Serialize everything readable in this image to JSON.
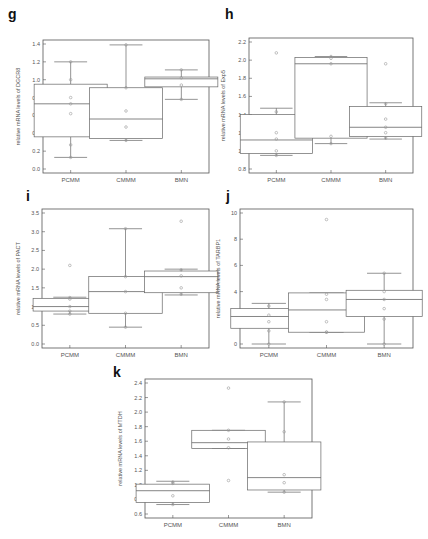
{
  "figure": {
    "panels": [
      {
        "id": "g",
        "letter": "g"
      },
      {
        "id": "h",
        "letter": "h"
      },
      {
        "id": "i",
        "letter": "i"
      },
      {
        "id": "j",
        "letter": "j"
      },
      {
        "id": "k",
        "letter": "k"
      }
    ]
  },
  "chart_data": [
    {
      "panel": "g",
      "type": "box",
      "title": "",
      "xlabel": "",
      "ylabel": "relative mRNA levels of DGCR8",
      "categories": [
        "PCMM",
        "CMMM",
        "BMN"
      ],
      "ylim": [
        0.0,
        1.4
      ],
      "yticks": [
        "0.0",
        "0.2",
        "0.4",
        "0.6",
        "0.8",
        "1.0",
        "1.2",
        "1.4"
      ],
      "grid": false,
      "series": [
        {
          "name": "PCMM",
          "whisker_low": 0.13,
          "q1": 0.36,
          "median": 0.73,
          "q3": 0.95,
          "whisker_high": 1.2,
          "points": [
            0.13,
            0.27,
            0.62,
            0.73,
            0.8,
            1.0,
            1.2
          ],
          "outliers": []
        },
        {
          "name": "CMMM",
          "whisker_low": 0.32,
          "q1": 0.34,
          "median": 0.56,
          "q3": 0.91,
          "whisker_high": 1.39,
          "points": [
            0.32,
            0.47,
            0.65,
            0.91,
            1.39
          ],
          "outliers": []
        },
        {
          "name": "BMN",
          "whisker_low": 0.78,
          "q1": 0.92,
          "median": 1.01,
          "q3": 1.03,
          "whisker_high": 1.11,
          "points": [
            0.78,
            0.94,
            1.02,
            1.11
          ],
          "outliers": []
        }
      ]
    },
    {
      "panel": "h",
      "type": "box",
      "title": "",
      "xlabel": "",
      "ylabel": "relative mRNA levels of Exp5",
      "categories": [
        "PCMM",
        "CMMM",
        "BMN"
      ],
      "ylim": [
        0.8,
        2.2
      ],
      "yticks": [
        "0.8",
        "1.0",
        "1.2",
        "1.4",
        "1.6",
        "1.8",
        "2.0",
        "2.2"
      ],
      "grid": false,
      "series": [
        {
          "name": "PCMM",
          "whisker_low": 0.95,
          "q1": 0.97,
          "median": 1.12,
          "q3": 1.4,
          "whisker_high": 1.47,
          "points": [
            0.95,
            1.0,
            1.13,
            1.2,
            1.43
          ],
          "outliers": [
            2.08
          ]
        },
        {
          "name": "CMMM",
          "whisker_low": 1.08,
          "q1": 1.14,
          "median": 1.96,
          "q3": 2.03,
          "whisker_high": 2.04,
          "points": [
            1.08,
            1.16,
            1.96,
            2.02,
            2.04
          ],
          "outliers": []
        },
        {
          "name": "BMN",
          "whisker_low": 1.13,
          "q1": 1.16,
          "median": 1.26,
          "q3": 1.49,
          "whisker_high": 1.53,
          "points": [
            1.14,
            1.2,
            1.26,
            1.35,
            1.52
          ],
          "outliers": [
            1.96
          ]
        }
      ]
    },
    {
      "panel": "i",
      "type": "box",
      "title": "",
      "xlabel": "",
      "ylabel": "relative mRNA levels of PACT",
      "categories": [
        "PCMM",
        "CMMM",
        "BMN"
      ],
      "ylim": [
        0.0,
        3.5
      ],
      "yticks": [
        "0.0",
        "0.5",
        "1.0",
        "1.5",
        "2.0",
        "2.5",
        "3.0",
        "3.5"
      ],
      "grid": false,
      "series": [
        {
          "name": "PCMM",
          "whisker_low": 0.8,
          "q1": 0.88,
          "median": 1.0,
          "q3": 1.22,
          "whisker_high": 1.25,
          "points": [
            0.8,
            0.88,
            1.0,
            1.2,
            1.24
          ],
          "outliers": [
            2.1
          ]
        },
        {
          "name": "CMMM",
          "whisker_low": 0.45,
          "q1": 0.82,
          "median": 1.4,
          "q3": 1.8,
          "whisker_high": 3.08,
          "points": [
            0.45,
            0.82,
            1.4,
            1.8,
            3.08
          ],
          "outliers": []
        },
        {
          "name": "BMN",
          "whisker_low": 1.31,
          "q1": 1.37,
          "median": 1.8,
          "q3": 1.95,
          "whisker_high": 2.0,
          "points": [
            1.33,
            1.5,
            1.82,
            1.98
          ],
          "outliers": [
            3.28
          ]
        }
      ]
    },
    {
      "panel": "j",
      "type": "box",
      "title": "",
      "xlabel": "",
      "ylabel": "relative mRNA levels of TARBP1",
      "categories": [
        "PCMM",
        "CMMM",
        "BMN"
      ],
      "ylim": [
        0,
        10
      ],
      "yticks": [
        "0",
        "2",
        "4",
        "6",
        "8",
        "10"
      ],
      "grid": false,
      "series": [
        {
          "name": "PCMM",
          "whisker_low": 0.0,
          "q1": 1.2,
          "median": 2.1,
          "q3": 2.7,
          "whisker_high": 3.1,
          "points": [
            0.0,
            1.0,
            1.7,
            2.2,
            2.9
          ],
          "outliers": []
        },
        {
          "name": "CMMM",
          "whisker_low": 0.9,
          "q1": 0.9,
          "median": 2.6,
          "q3": 3.9,
          "whisker_high": 3.9,
          "points": [
            0.9,
            0.9,
            1.7,
            3.4,
            3.8
          ],
          "outliers": [
            9.5
          ]
        },
        {
          "name": "BMN",
          "whisker_low": 0.0,
          "q1": 2.1,
          "median": 3.4,
          "q3": 4.1,
          "whisker_high": 5.4,
          "points": [
            0.0,
            1.9,
            2.7,
            3.4,
            4.0,
            5.4
          ],
          "outliers": []
        }
      ]
    },
    {
      "panel": "k",
      "type": "box",
      "title": "",
      "xlabel": "",
      "ylabel": "relative mRNA levels of MTDH",
      "categories": [
        "PCMM",
        "CMMM",
        "BMN"
      ],
      "ylim": [
        0.6,
        2.4
      ],
      "yticks": [
        "0.6",
        "0.8",
        "1.0",
        "1.2",
        "1.4",
        "1.6",
        "1.8",
        "2.0",
        "2.2",
        "2.4"
      ],
      "grid": false,
      "series": [
        {
          "name": "PCMM",
          "whisker_low": 0.73,
          "q1": 0.76,
          "median": 0.92,
          "q3": 1.01,
          "whisker_high": 1.05,
          "points": [
            0.73,
            0.85,
            1.02,
            1.04
          ],
          "outliers": []
        },
        {
          "name": "CMMM",
          "whisker_low": 1.5,
          "q1": 1.5,
          "median": 1.58,
          "q3": 1.75,
          "whisker_high": 1.75,
          "points": [
            1.51,
            1.63,
            1.75
          ],
          "outliers": [
            2.33,
            1.06
          ]
        },
        {
          "name": "BMN",
          "whisker_low": 0.9,
          "q1": 0.93,
          "median": 1.1,
          "q3": 1.59,
          "whisker_high": 2.14,
          "points": [
            0.9,
            1.03,
            1.14,
            1.73,
            2.14
          ],
          "outliers": []
        }
      ]
    }
  ],
  "layout": {
    "g": {
      "letter_x": 8,
      "letter_y": 6,
      "frame": [
        43,
        40,
        209,
        173
      ],
      "ytitle_x": 20
    },
    "h": {
      "letter_x": 225,
      "letter_y": 6,
      "frame": [
        249,
        38,
        413,
        173
      ],
      "ytitle_x": 225
    },
    "i": {
      "letter_x": 26,
      "letter_y": 188,
      "frame": [
        42,
        209,
        209,
        348
      ],
      "ytitle_x": 20
    },
    "j": {
      "letter_x": 226,
      "letter_y": 188,
      "frame": [
        240,
        209,
        413,
        348
      ],
      "ytitle_x": 220
    },
    "k": {
      "letter_x": 113,
      "letter_y": 364,
      "frame": [
        145,
        379,
        312,
        518
      ],
      "ytitle_x": 122
    }
  },
  "style": {
    "line": "#666666",
    "point": "#999999",
    "frame": "#555555"
  }
}
